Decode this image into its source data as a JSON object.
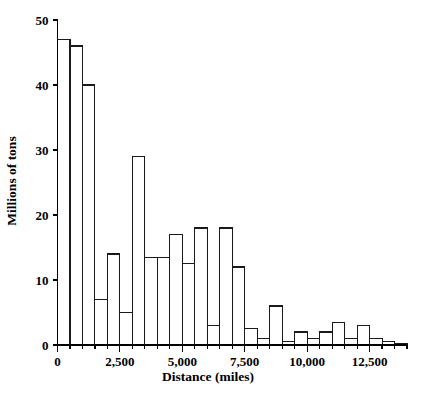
{
  "chart_data": {
    "type": "bar",
    "title": "",
    "subtitle": "",
    "xlabel": "Distance (miles)",
    "ylabel": "Millions of tons",
    "grid": false,
    "legend": false,
    "legend_position": "none",
    "xlim": [
      0,
      14000
    ],
    "ylim": [
      0,
      50
    ],
    "bin_width": 500,
    "x_ticks": [
      0,
      2500,
      5000,
      7500,
      10000,
      12500
    ],
    "x_tick_labels": [
      "0",
      "2,500",
      "5,000",
      "7,500",
      "10,000",
      "12,500"
    ],
    "y_ticks": [
      0,
      10,
      20,
      30,
      40,
      50
    ],
    "y_tick_labels": [
      "0",
      "10",
      "20",
      "30",
      "40",
      "50"
    ],
    "x_minor_tick_step": 500,
    "bin_starts": [
      0,
      500,
      1000,
      1500,
      2000,
      2500,
      3000,
      3500,
      4000,
      4500,
      5000,
      5500,
      6000,
      6500,
      7000,
      7500,
      8000,
      8500,
      9000,
      9500,
      10000,
      10500,
      11000,
      11500,
      12000,
      12500,
      13000,
      13500
    ],
    "categories": [
      "0-500",
      "500-1,000",
      "1,000-1,500",
      "1,500-2,000",
      "2,000-2,500",
      "2,500-3,000",
      "3,000-3,500",
      "3,500-4,000",
      "4,000-4,500",
      "4,500-5,000",
      "5,000-5,500",
      "5,500-6,000",
      "6,000-6,500",
      "6,500-7,000",
      "7,000-7,500",
      "7,500-8,000",
      "8,000-8,500",
      "8,500-9,000",
      "9,000-9,500",
      "9,500-10,000",
      "10,000-10,500",
      "10,500-11,000",
      "11,000-11,500",
      "11,500-12,000",
      "12,000-12,500",
      "12,500-13,000",
      "13,000-13,500",
      "13,500-14,000"
    ],
    "values": [
      47,
      46,
      40,
      7,
      14,
      5,
      29,
      13.5,
      13.5,
      17,
      12.5,
      18,
      3,
      18,
      12,
      2.5,
      1,
      6,
      0.5,
      2,
      1,
      2,
      3.5,
      1,
      3,
      1,
      0.5,
      0.3
    ],
    "bar_style": {
      "fill": "#ffffff",
      "stroke": "#1a1a1a"
    }
  },
  "axes": {
    "x_title": "Distance (miles)",
    "y_title": "Millions of tons"
  },
  "colors": {
    "axis": "#000000",
    "bar_outline": "#1a1a1a",
    "bar_fill": "#ffffff",
    "background": "#ffffff"
  }
}
